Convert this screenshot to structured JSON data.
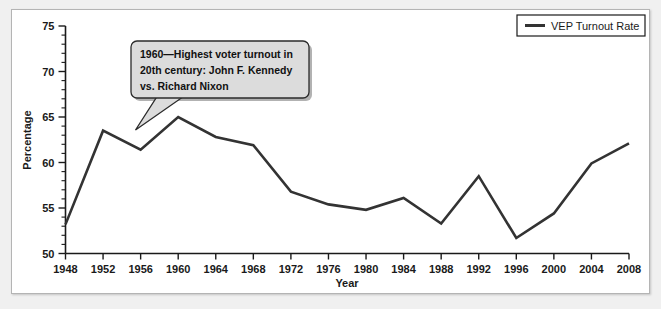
{
  "chart_data": {
    "type": "line",
    "title": "",
    "xlabel": "Year",
    "ylabel": "Percentage",
    "xlim": [
      1948,
      2008
    ],
    "ylim": [
      50,
      75
    ],
    "y_ticks": [
      50,
      55,
      60,
      65,
      70,
      75
    ],
    "y_minor_step": 1,
    "grid": false,
    "legend_position": "top-right",
    "categories": [
      1948,
      1952,
      1956,
      1960,
      1964,
      1968,
      1972,
      1976,
      1980,
      1984,
      1988,
      1992,
      1996,
      2000,
      2004,
      2008
    ],
    "x_tick_labels": [
      "1948",
      "1952",
      "1956",
      "1960",
      "1964",
      "1968",
      "1972",
      "1976",
      "1980",
      "1984",
      "1988",
      "1992",
      "1996",
      "2000",
      "2004",
      "2008"
    ],
    "y_tick_labels": [
      "50",
      "55",
      "60",
      "65",
      "70",
      "75"
    ],
    "series": [
      {
        "name": "VEP Turnout Rate",
        "color": "#333333",
        "values": [
          53.2,
          63.5,
          61.4,
          65.0,
          62.8,
          61.9,
          56.8,
          55.4,
          54.8,
          56.1,
          53.3,
          58.5,
          51.7,
          54.4,
          59.9,
          62.1
        ]
      }
    ],
    "annotations": [
      {
        "name": "peak-1960-callout",
        "target_year": 1960,
        "target_value": 65.0,
        "lines": [
          "1960—Highest voter turnout in",
          "20th century: John F. Kennedy",
          "vs. Richard Nixon"
        ]
      }
    ]
  },
  "legend": {
    "entries": [
      {
        "label": "VEP Turnout Rate",
        "color": "#333333"
      }
    ]
  },
  "colors": {
    "series": "#333333",
    "axis": "#1a1a1a",
    "panel_background": "#ffffff",
    "outer_background": "#f0f0f0",
    "callout_fill": "#dcdcdc",
    "callout_border": "#2b2b2b"
  }
}
